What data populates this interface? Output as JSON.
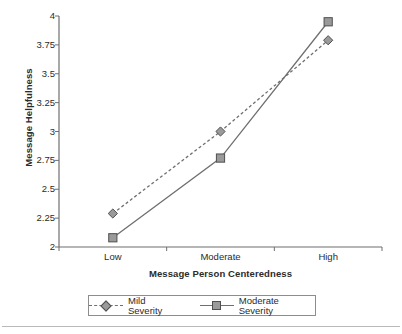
{
  "chart_data": {
    "type": "line",
    "title": "",
    "xlabel": "Message Person Centeredness",
    "ylabel": "Message Helpfulness",
    "categories": [
      "Low",
      "Moderate",
      "High"
    ],
    "ylim": [
      2,
      4
    ],
    "yticks": [
      "2",
      "2.25",
      "2.5",
      "2.75",
      "3",
      "3.25",
      "3.5",
      "3.75",
      "4"
    ],
    "ytick_values": [
      2,
      2.25,
      2.5,
      2.75,
      3,
      3.25,
      3.5,
      3.75,
      4
    ],
    "grid": false,
    "legend_position": "bottom",
    "series": [
      {
        "name": "Mild Severity",
        "values": [
          2.29,
          3.0,
          3.79
        ],
        "marker": "diamond",
        "linestyle": "dashed",
        "color": "#6f6f6f",
        "marker_fill": "#9a9a9a"
      },
      {
        "name": "Moderate Severity",
        "values": [
          2.08,
          2.77,
          3.95
        ],
        "marker": "square",
        "linestyle": "solid",
        "color": "#6f6f6f",
        "marker_fill": "#9a9a9a"
      }
    ]
  },
  "axes": {
    "y_title": "Message Helpfulness",
    "x_title": "Message Person Centeredness",
    "y_labels": [
      "4",
      "3.75",
      "3.5",
      "3.25",
      "3",
      "2.75",
      "2.5",
      "2.25",
      "2"
    ],
    "x_labels": [
      "Low",
      "Moderate",
      "High"
    ]
  },
  "legend": {
    "items": [
      {
        "label": "Mild Severity"
      },
      {
        "label": "Moderate Severity"
      }
    ]
  },
  "colors": {
    "axis": "#6f6f6f",
    "line": "#6f6f6f",
    "marker_fill": "#9a9a9a",
    "marker_edge": "#4f4f4f",
    "text": "#2b2b2b",
    "legend_border": "#8d8d8d",
    "rule": "#b9b9b9"
  }
}
